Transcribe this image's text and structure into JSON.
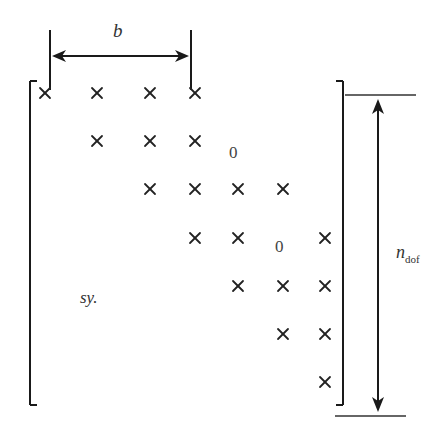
{
  "diagram": {
    "bandwidth_label": "b",
    "dof_label": "n",
    "dof_subscript": "dof",
    "symmetry_label": "sy.",
    "zero_labels": [
      "0",
      "0"
    ],
    "nonzero_symbol": "×",
    "colors": {
      "ink": "#1a1a1a",
      "background": "#ffffff"
    },
    "rows": [
      {
        "row": 1,
        "crosses_x": [
          45,
          97,
          150,
          195
        ],
        "y": 93
      },
      {
        "row": 2,
        "crosses_x": [
          97,
          150,
          195
        ],
        "y": 141
      },
      {
        "row": 3,
        "crosses_x": [
          150,
          195,
          238,
          283
        ],
        "y": 189
      },
      {
        "row": 4,
        "crosses_x": [
          195,
          238,
          325
        ],
        "y": 238
      },
      {
        "row": 5,
        "crosses_x": [
          238,
          283,
          325
        ],
        "y": 286
      },
      {
        "row": 6,
        "crosses_x": [
          283,
          325
        ],
        "y": 334
      },
      {
        "row": 7,
        "crosses_x": [
          325
        ],
        "y": 382
      }
    ]
  }
}
